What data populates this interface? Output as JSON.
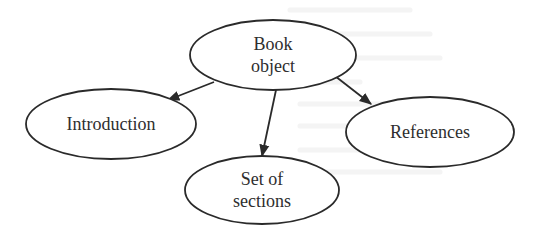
{
  "diagram": {
    "type": "concept-tree",
    "stroke_color": "#2a2a2a",
    "text_color": "#2e2e2e",
    "background": "#ffffff",
    "nodes": [
      {
        "id": "book",
        "lines": [
          "Book",
          "object"
        ],
        "cx": 273,
        "cy": 55,
        "rx": 83,
        "ry": 35
      },
      {
        "id": "introduction",
        "lines": [
          "Introduction"
        ],
        "cx": 111,
        "cy": 124,
        "rx": 85,
        "ry": 35
      },
      {
        "id": "sections",
        "lines": [
          "Set of",
          "sections"
        ],
        "cx": 262,
        "cy": 190,
        "rx": 77,
        "ry": 34
      },
      {
        "id": "references",
        "lines": [
          "References"
        ],
        "cx": 430,
        "cy": 132,
        "rx": 84,
        "ry": 35
      }
    ],
    "edges": [
      {
        "from": "book",
        "to": "introduction",
        "x1": 214,
        "y1": 82,
        "x2": 168,
        "y2": 100
      },
      {
        "from": "book",
        "to": "sections",
        "x1": 276,
        "y1": 90,
        "x2": 262,
        "y2": 156
      },
      {
        "from": "book",
        "to": "references",
        "x1": 335,
        "y1": 76,
        "x2": 371,
        "y2": 104
      }
    ]
  }
}
